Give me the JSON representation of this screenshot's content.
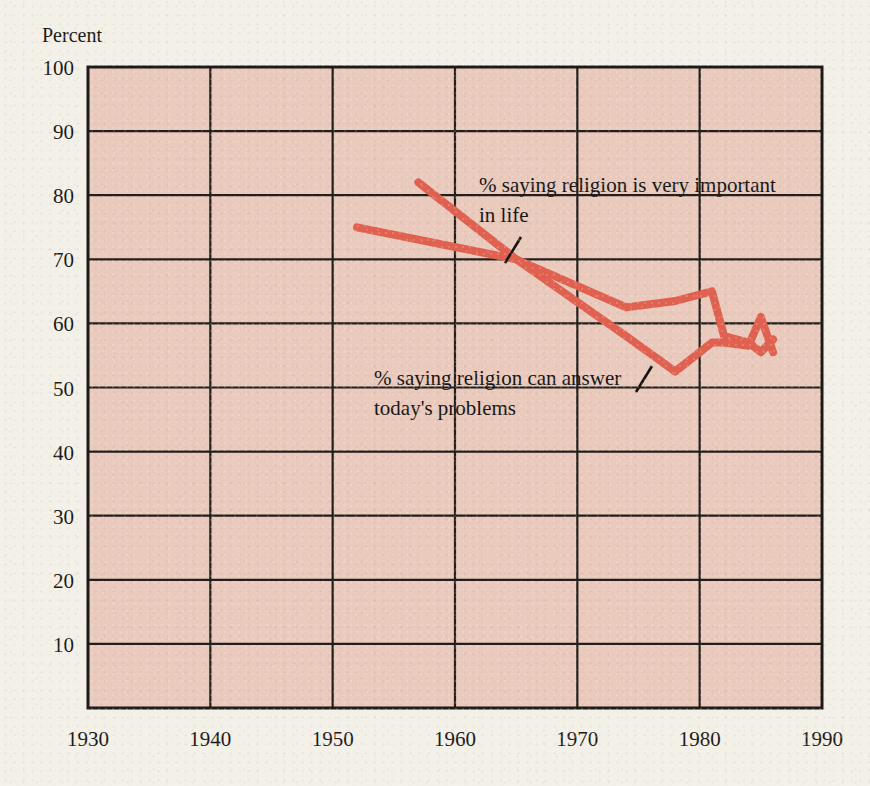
{
  "figure": {
    "background_color": "#f3f0e8",
    "plot_background_color": "#e9cabd",
    "axis_color": "#1c1a18",
    "line_color": "#e0614f"
  },
  "axes": {
    "y_axis_title": "Percent",
    "y_ticks": [
      "10",
      "20",
      "30",
      "40",
      "50",
      "60",
      "70",
      "80",
      "90",
      "100"
    ],
    "x_ticks": [
      "1930",
      "1940",
      "1950",
      "1960",
      "1970",
      "1980",
      "1990"
    ]
  },
  "annotations": {
    "series1_line1": "% saying religion is very important",
    "series1_line2": "in life",
    "series2_line1": "% saying religion can answer",
    "series2_line2": "today's problems"
  },
  "chart_data": {
    "type": "line",
    "title": "",
    "xlabel": "",
    "ylabel": "Percent",
    "xlim": [
      1930,
      1990
    ],
    "ylim": [
      0,
      100
    ],
    "x_ticks": [
      1930,
      1940,
      1950,
      1960,
      1970,
      1980,
      1990
    ],
    "y_ticks": [
      10,
      20,
      30,
      40,
      50,
      60,
      70,
      80,
      90,
      100
    ],
    "grid": true,
    "legend": "inline-annotations",
    "series": [
      {
        "name": "% saying religion is very important in life",
        "color": "#e0614f",
        "x": [
          1952,
          1965,
          1974,
          1978,
          1981,
          1982,
          1984,
          1985,
          1986
        ],
        "values": [
          75,
          70,
          62.5,
          63.5,
          65,
          58,
          57,
          55.5,
          57.5
        ]
      },
      {
        "name": "% saying religion can answer today's problems",
        "color": "#e0614f",
        "x": [
          1957,
          1965,
          1974,
          1978,
          1981,
          1982,
          1984,
          1985,
          1986
        ],
        "values": [
          82,
          70,
          58,
          52.5,
          57,
          57,
          56.5,
          61,
          55.5
        ]
      }
    ]
  }
}
